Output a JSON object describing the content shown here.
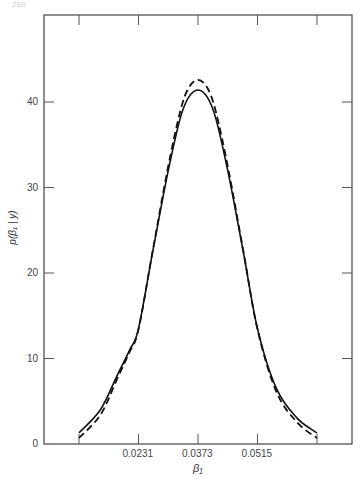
{
  "page": {
    "number": "260"
  },
  "chart_data": {
    "type": "line",
    "title": "",
    "xlabel": "β₁",
    "ylabel": "p(β₁ | y)",
    "x_ticks": [
      0.0231,
      0.0373,
      0.0515
    ],
    "x_tick_labels": [
      "0.0231",
      "0.0373",
      "0.0515"
    ],
    "y_ticks": [
      0,
      10,
      20,
      30,
      40
    ],
    "y_tick_labels": [
      "0",
      "10",
      "20",
      "30",
      "40"
    ],
    "xlim": [
      0.0003,
      0.0755
    ],
    "ylim": [
      0,
      50.5
    ],
    "grid": false,
    "legend": null,
    "series": [
      {
        "name": "solid",
        "style": "solid",
        "x": [
          0.0089,
          0.014,
          0.018,
          0.021,
          0.0231,
          0.0265,
          0.03,
          0.033,
          0.035,
          0.0373,
          0.0396,
          0.0416,
          0.0446,
          0.0481,
          0.0515,
          0.056,
          0.061,
          0.0657
        ],
        "y": [
          1.3,
          4.0,
          8.0,
          11.0,
          13.5,
          22.5,
          31.5,
          38.0,
          40.5,
          41.4,
          40.5,
          38.0,
          31.5,
          22.5,
          13.5,
          6.5,
          3.0,
          1.3
        ]
      },
      {
        "name": "dashed",
        "style": "dashed",
        "x": [
          0.0089,
          0.014,
          0.018,
          0.021,
          0.0231,
          0.0265,
          0.03,
          0.033,
          0.035,
          0.0373,
          0.0396,
          0.0416,
          0.0446,
          0.0481,
          0.0515,
          0.056,
          0.061,
          0.0657
        ],
        "y": [
          0.7,
          3.4,
          7.6,
          10.8,
          13.4,
          22.6,
          32.0,
          38.8,
          41.6,
          42.6,
          41.6,
          38.8,
          32.0,
          22.6,
          13.4,
          6.1,
          2.5,
          0.7
        ]
      }
    ]
  }
}
